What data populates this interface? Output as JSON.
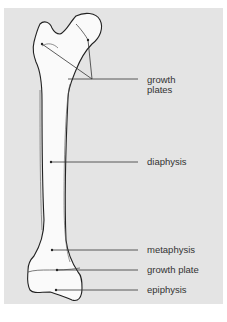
{
  "diagram": {
    "colors": {
      "panel_background": "#e4e4e4",
      "bone_fill": "#fafafa",
      "outline": "#222222",
      "leader_line": "#333333",
      "label_text": "#333333"
    },
    "labels": [
      {
        "id": "growth-plates",
        "line1": "growth",
        "line2": "plates"
      },
      {
        "id": "diaphysis",
        "text": "diaphysis"
      },
      {
        "id": "metaphysis",
        "text": "metaphysis"
      },
      {
        "id": "growth-plate",
        "text": "growth plate"
      },
      {
        "id": "epiphysis",
        "text": "epiphysis"
      }
    ]
  }
}
